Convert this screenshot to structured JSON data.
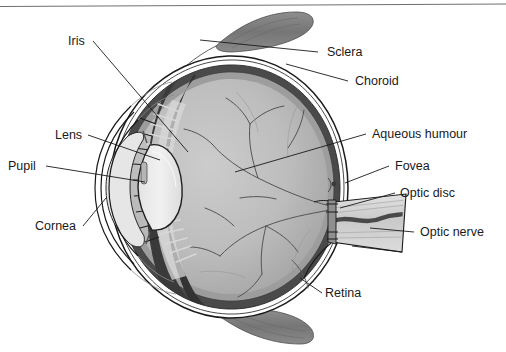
{
  "figure": {
    "type": "anatomical-diagram",
    "background_color": "#ffffff",
    "line_color": "#1a1a1a",
    "frame": {
      "top_rule": true
    }
  },
  "palette": {
    "sclera_white": "#ffffff",
    "choroid_dark": "#4a4a4a",
    "choroid_darker": "#3c3c3c",
    "vitreous_light": "#c9c9c9",
    "vitreous_mid": "#b4b4b4",
    "retina_grey": "#9d9d9d",
    "iris_dark": "#3a3a3a",
    "ciliary_light": "#d8d8d8",
    "lens_light": "#ededed",
    "muscle_grey": "#7e7e7e",
    "nerve_light": "#d2d2d2",
    "nerve_dark": "#4a4a4a",
    "vessel": "#555555"
  },
  "labels": [
    {
      "id": "iris",
      "text": "Iris",
      "x": 68,
      "y": 45,
      "anchor": "start"
    },
    {
      "id": "sclera",
      "text": "Sclera",
      "x": 327,
      "y": 56,
      "anchor": "start"
    },
    {
      "id": "choroid",
      "text": "Choroid",
      "x": 355,
      "y": 85,
      "anchor": "start"
    },
    {
      "id": "lens",
      "text": "Lens",
      "x": 55,
      "y": 139,
      "anchor": "start"
    },
    {
      "id": "aqueous_humour",
      "text": "Aqueous humour",
      "x": 372,
      "y": 138,
      "anchor": "start"
    },
    {
      "id": "pupil",
      "text": "Pupil",
      "x": 8,
      "y": 170,
      "anchor": "start"
    },
    {
      "id": "fovea",
      "text": "Fovea",
      "x": 395,
      "y": 170,
      "anchor": "start"
    },
    {
      "id": "optic_disc",
      "text": "Optic disc",
      "x": 400,
      "y": 197,
      "anchor": "start"
    },
    {
      "id": "cornea",
      "text": "Cornea",
      "x": 35,
      "y": 230,
      "anchor": "start"
    },
    {
      "id": "optic_nerve",
      "text": "Optic nerve",
      "x": 420,
      "y": 236,
      "anchor": "start"
    },
    {
      "id": "retina",
      "text": "Retina",
      "x": 325,
      "y": 297,
      "anchor": "start"
    }
  ],
  "leaders": [
    {
      "id": "iris",
      "points": "93,41 188,152"
    },
    {
      "id": "sclera",
      "points": "318,52 200,40"
    },
    {
      "id": "choroid",
      "points": "348,81 286,64"
    },
    {
      "id": "lens",
      "points": "88,135 160,160"
    },
    {
      "id": "aqueous_humour",
      "points": "366,134 235,172"
    },
    {
      "id": "pupil",
      "points": "46,166 145,182"
    },
    {
      "id": "fovea",
      "points": "389,166 345,183"
    },
    {
      "id": "optic_disc",
      "points": "395,193 340,208"
    },
    {
      "id": "cornea",
      "points": "83,226 106,198"
    },
    {
      "id": "optic_nerve",
      "points": "414,232 370,228"
    },
    {
      "id": "retina",
      "points": "322,293 300,278"
    }
  ]
}
